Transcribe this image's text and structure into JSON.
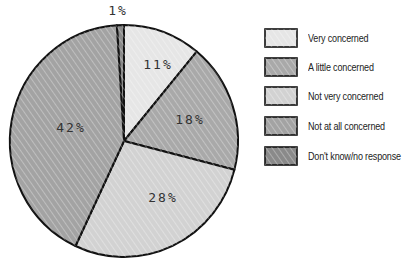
{
  "chart_data": {
    "type": "pie",
    "title": "",
    "categories": [
      "Very concerned",
      "A little concerned",
      "Not very concerned",
      "Not at all concerned",
      "Don't know/no response"
    ],
    "values": [
      11,
      18,
      28,
      42,
      1
    ],
    "labels": [
      "11%",
      "18%",
      "28%",
      "42%",
      "1%"
    ],
    "colors": [
      "#e6e6e6",
      "#a9a9a9",
      "#d2d2d2",
      "#a3a3a3",
      "#8a8a8a"
    ],
    "legend_position": "right",
    "style": "hand-drawn hatched"
  },
  "legend": {
    "items": [
      {
        "label": "Very concerned",
        "color": "#e6e6e6"
      },
      {
        "label": "A little concerned",
        "color": "#a9a9a9"
      },
      {
        "label": "Not very concerned",
        "color": "#d2d2d2"
      },
      {
        "label": "Not at all concerned",
        "color": "#a3a3a3"
      },
      {
        "label": "Don't know/no response",
        "color": "#8a8a8a"
      }
    ]
  },
  "slice_labels": {
    "very": "11%",
    "little": "18%",
    "notvery": "28%",
    "notatall": "42%",
    "dk": "1%"
  }
}
